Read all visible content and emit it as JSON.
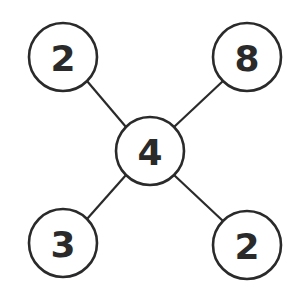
{
  "diagram": {
    "type": "number-web",
    "center": {
      "id": "center",
      "value": "4",
      "cx": 150,
      "cy": 151
    },
    "nodes": [
      {
        "id": "top-left",
        "value": "2",
        "cx": 63,
        "cy": 57
      },
      {
        "id": "top-right",
        "value": "8",
        "cx": 247,
        "cy": 57
      },
      {
        "id": "bottom-left",
        "value": "3",
        "cx": 63,
        "cy": 243
      },
      {
        "id": "bottom-right",
        "value": "2",
        "cx": 247,
        "cy": 245
      }
    ],
    "radius": 34,
    "colors": {
      "stroke": "#2a2a2a",
      "fill": "#ffffff",
      "background": "#ffffff"
    }
  }
}
